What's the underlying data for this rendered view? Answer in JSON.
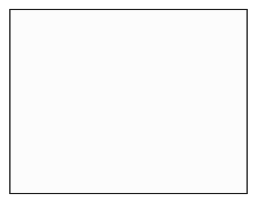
{
  "figure": {
    "kind": "cfd-mesh-diagram",
    "width": 258,
    "height": 202,
    "background_color": "#ffffff"
  },
  "frame": {
    "x": 10,
    "y": 9.5,
    "width": 237,
    "height": 184,
    "fill_color": "#fcfcfc",
    "border_color": "#1a1a1a",
    "border_width": 1.1
  },
  "style": {
    "grid_color": "#3b3b3b",
    "grid_width": 0.62,
    "block_edge_color": "#101010",
    "block_edge_width": 1.05,
    "body_fill": "#f3f3f3",
    "body_stroke": "#0d0d0d"
  },
  "domain": {
    "x_min": 10,
    "x_max": 247,
    "y_min": 9.5,
    "y_max": 193.5,
    "nx": 58,
    "ny": 45
  },
  "body": {
    "name": "airfoil-section",
    "leading_edge": [
      84.5,
      102.0
    ],
    "trailing_edge": [
      163.0,
      100.5
    ],
    "chord": 78.5,
    "max_thickness": 24.0,
    "outline": [
      [
        84.5,
        104.5
      ],
      [
        85.2,
        99.0
      ],
      [
        88.0,
        94.6
      ],
      [
        93.5,
        91.6
      ],
      [
        101.0,
        89.9
      ],
      [
        110.0,
        89.2
      ],
      [
        121.0,
        89.6
      ],
      [
        133.0,
        91.4
      ],
      [
        145.0,
        94.4
      ],
      [
        155.0,
        97.5
      ],
      [
        163.0,
        100.5
      ],
      [
        152.0,
        104.8
      ],
      [
        139.0,
        108.6
      ],
      [
        126.0,
        111.4
      ],
      [
        113.0,
        113.2
      ],
      [
        102.0,
        113.4
      ],
      [
        93.5,
        112.0
      ],
      [
        87.5,
        109.3
      ]
    ]
  },
  "blocks": [
    {
      "id": "block-upper-left-skew",
      "label": "upper-left oblique block",
      "shear": -0.95,
      "region": [
        10,
        9.5,
        122,
        96
      ]
    },
    {
      "id": "block-ogrid",
      "label": "O-grid around airfoil",
      "region": [
        68,
        78,
        118,
        50
      ]
    },
    {
      "id": "block-upper-right",
      "label": "upper-right block",
      "region": [
        168,
        9.5,
        79,
        78
      ]
    },
    {
      "id": "block-lower-left",
      "label": "lower-left block",
      "region": [
        10,
        120,
        120,
        73
      ]
    },
    {
      "id": "block-lower-mid-skew",
      "label": "lower-middle oblique block",
      "shear": 0.55,
      "region": [
        118,
        118,
        95,
        62
      ]
    },
    {
      "id": "block-lower-right",
      "label": "lower-right block",
      "region": [
        205,
        118,
        42,
        75
      ]
    }
  ],
  "block_boundaries": [
    {
      "name": "upper-left-block-lower-edge",
      "points": [
        [
          10,
          76
        ],
        [
          34,
          74
        ],
        [
          58,
          69
        ],
        [
          80,
          59
        ],
        [
          99,
          45
        ],
        [
          112,
          30
        ],
        [
          120,
          16
        ],
        [
          124,
          9.5
        ]
      ]
    },
    {
      "name": "upper-left-block-outer-edge",
      "points": [
        [
          10,
          88
        ],
        [
          30,
          89
        ],
        [
          52,
          88
        ],
        [
          70,
          84
        ],
        [
          84,
          76
        ],
        [
          94,
          64
        ],
        [
          100,
          48
        ],
        [
          103,
          28
        ],
        [
          104,
          9.5
        ]
      ]
    },
    {
      "name": "upper-mid-junction-left",
      "points": [
        [
          132,
          58
        ],
        [
          137,
          48
        ],
        [
          140,
          39
        ],
        [
          141,
          31
        ]
      ]
    },
    {
      "name": "upper-mid-junction-right",
      "points": [
        [
          141,
          31
        ],
        [
          146,
          41
        ],
        [
          150,
          52
        ],
        [
          152,
          62
        ]
      ]
    },
    {
      "name": "upper-mid-junction-stem",
      "points": [
        [
          141,
          31
        ],
        [
          140,
          22
        ],
        [
          141,
          14
        ],
        [
          142,
          9.5
        ]
      ]
    },
    {
      "name": "upper-right-arc",
      "points": [
        [
          247,
          36
        ],
        [
          232,
          35
        ],
        [
          218,
          38
        ],
        [
          209,
          45
        ],
        [
          205,
          54
        ],
        [
          205,
          63
        ]
      ]
    },
    {
      "name": "upper-right-arc-stem",
      "points": [
        [
          205,
          63
        ],
        [
          203,
          73
        ],
        [
          200,
          80
        ]
      ]
    },
    {
      "name": "ogrid-outer-upper",
      "points": [
        [
          70,
          94
        ],
        [
          74,
          82
        ],
        [
          84,
          72
        ],
        [
          100,
          66
        ],
        [
          120,
          64
        ],
        [
          142,
          67
        ],
        [
          160,
          74
        ],
        [
          172,
          84
        ]
      ]
    },
    {
      "name": "ogrid-outer-lower",
      "points": [
        [
          70,
          108
        ],
        [
          74,
          120
        ],
        [
          86,
          130
        ],
        [
          104,
          136
        ],
        [
          124,
          137
        ],
        [
          146,
          132
        ],
        [
          163,
          122
        ],
        [
          172,
          110
        ]
      ]
    },
    {
      "name": "ogrid-outer-right",
      "points": [
        [
          172,
          84
        ],
        [
          176,
          96
        ],
        [
          174,
          104
        ],
        [
          172,
          110
        ]
      ]
    },
    {
      "name": "wake-cut-upper",
      "points": [
        [
          163,
          100.5
        ],
        [
          176,
          99
        ],
        [
          190,
          98
        ],
        [
          206,
          98
        ]
      ]
    },
    {
      "name": "lower-left-junction",
      "points": [
        [
          44,
          128
        ],
        [
          47,
          138
        ],
        [
          48,
          146
        ]
      ]
    },
    {
      "name": "lower-left-junction-right",
      "points": [
        [
          48,
          146
        ],
        [
          55,
          139
        ],
        [
          60,
          132
        ]
      ]
    },
    {
      "name": "lower-mid-junction-a",
      "points": [
        [
          95,
          152
        ],
        [
          102,
          146
        ],
        [
          108,
          142
        ]
      ]
    },
    {
      "name": "lower-mid-junction-b",
      "points": [
        [
          108,
          142
        ],
        [
          114,
          149
        ],
        [
          118,
          156
        ]
      ]
    },
    {
      "name": "lower-mid-skew-top",
      "points": [
        [
          118,
          156
        ],
        [
          134,
          146
        ],
        [
          152,
          136
        ],
        [
          168,
          128
        ],
        [
          183,
          124
        ],
        [
          196,
          123
        ]
      ]
    },
    {
      "name": "lower-mid-skew-right",
      "points": [
        [
          196,
          123
        ],
        [
          202,
          133
        ],
        [
          206,
          145
        ],
        [
          208,
          158
        ]
      ]
    },
    {
      "name": "lower-right-junction",
      "points": [
        [
          164,
          160
        ],
        [
          170,
          154
        ],
        [
          176,
          151
        ]
      ]
    },
    {
      "name": "lower-right-junction-b",
      "points": [
        [
          176,
          151
        ],
        [
          181,
          158
        ],
        [
          184,
          166
        ]
      ]
    },
    {
      "name": "bottom-left-diag",
      "points": [
        [
          62,
          172
        ],
        [
          70,
          182
        ],
        [
          76,
          190
        ],
        [
          78,
          193.5
        ]
      ]
    },
    {
      "name": "bottom-right-diag",
      "points": [
        [
          214,
          178
        ],
        [
          220,
          186
        ],
        [
          223,
          193.5
        ]
      ]
    },
    {
      "name": "right-edge-kink",
      "points": [
        [
          247,
          124
        ],
        [
          238,
          126
        ],
        [
          230,
          131
        ]
      ]
    },
    {
      "name": "left-upper-corner-cut",
      "points": [
        [
          10,
          30
        ],
        [
          18,
          22
        ],
        [
          26,
          15
        ],
        [
          32,
          9.5
        ]
      ]
    }
  ],
  "annotations": {
    "caption": "",
    "axis_labels": []
  }
}
